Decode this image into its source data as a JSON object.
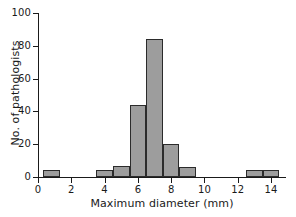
{
  "chart_data": {
    "type": "bar",
    "title": "",
    "subtitle": "",
    "xlabel": "Maximum diameter (mm)",
    "ylabel": "No. of pathologists",
    "xlim": [
      0,
      14.9
    ],
    "ylim": [
      0,
      100
    ],
    "grid": false,
    "legend": null,
    "bar_fill_color": "#9d9d9d",
    "bar_edge_color": "#2b2b2b",
    "axis_color": "#1a1a1a",
    "background_color": "#ffffff",
    "bin_width": 1,
    "x_ticks": [
      {
        "value": 0,
        "label": "0"
      },
      {
        "value": 2,
        "label": "2"
      },
      {
        "value": 4,
        "label": "4"
      },
      {
        "value": 6,
        "label": "6"
      },
      {
        "value": 8,
        "label": "8"
      },
      {
        "value": 10,
        "label": "10"
      },
      {
        "value": 12,
        "label": "12"
      },
      {
        "value": 14,
        "label": "14"
      }
    ],
    "y_ticks": [
      {
        "value": 0,
        "label": "0"
      },
      {
        "value": 20,
        "label": "20"
      },
      {
        "value": 40,
        "label": "40"
      },
      {
        "value": 60,
        "label": "60"
      },
      {
        "value": 80,
        "label": "80"
      },
      {
        "value": 100,
        "label": "100"
      }
    ],
    "bins": [
      {
        "x0": 0.3,
        "x1": 1.3,
        "value": 4
      },
      {
        "x0": 3.5,
        "x1": 4.5,
        "value": 4
      },
      {
        "x0": 4.5,
        "x1": 5.5,
        "value": 7
      },
      {
        "x0": 5.5,
        "x1": 6.5,
        "value": 44
      },
      {
        "x0": 6.5,
        "x1": 7.5,
        "value": 84
      },
      {
        "x0": 7.5,
        "x1": 8.5,
        "value": 20
      },
      {
        "x0": 8.5,
        "x1": 9.5,
        "value": 6
      },
      {
        "x0": 12.5,
        "x1": 13.5,
        "value": 4
      },
      {
        "x0": 13.5,
        "x1": 14.5,
        "value": 4
      }
    ],
    "categories": [
      "0.3-1.3",
      "3.5-4.5",
      "4.5-5.5",
      "5.5-6.5",
      "6.5-7.5",
      "7.5-8.5",
      "8.5-9.5",
      "12.5-13.5",
      "13.5-14.5"
    ],
    "values": [
      4,
      4,
      7,
      44,
      84,
      20,
      6,
      4,
      4
    ]
  }
}
